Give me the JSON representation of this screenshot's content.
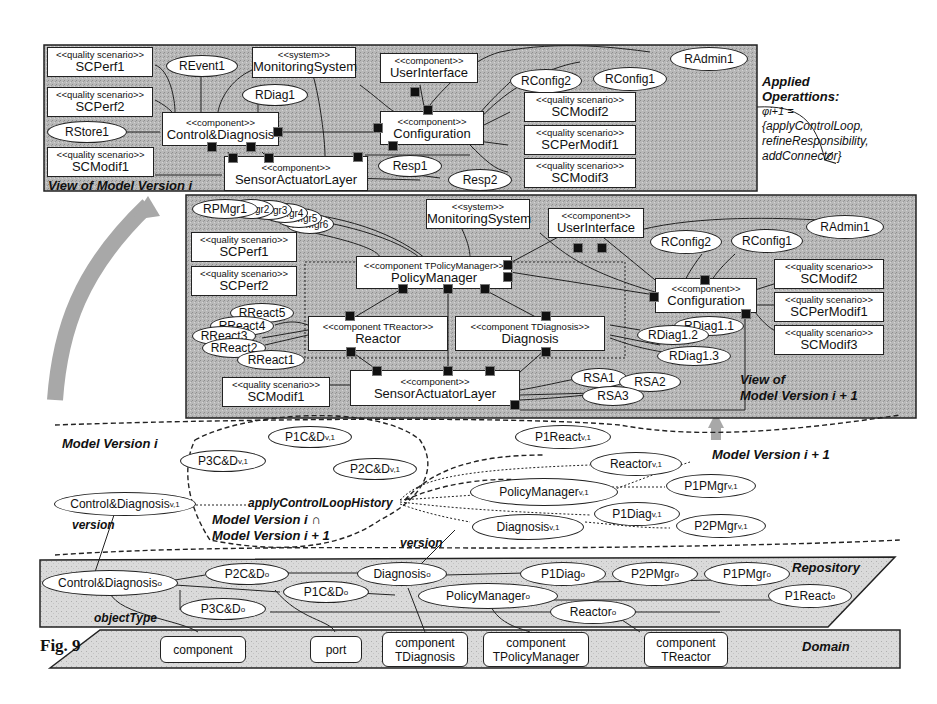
{
  "figure_label": "Fig. 9",
  "view_i": {
    "title": "View of Model Version i",
    "boxes": {
      "scperf1": {
        "stereo": "<<quality scenario>>",
        "name": "SCPerf1"
      },
      "scperf2": {
        "stereo": "<<quality scenario>>",
        "name": "SCPerf2"
      },
      "scmodif1": {
        "stereo": "<<quality scenario>>",
        "name": "SCModif1"
      },
      "monitoring": {
        "stereo": "<<system>>",
        "name": "MonitoringSystem"
      },
      "ui": {
        "stereo": "<<component>>",
        "name": "UserInterface"
      },
      "cd": {
        "stereo": "<<component>>",
        "name": "Control&Diagnosis"
      },
      "config": {
        "stereo": "<<component>>",
        "name": "Configuration"
      },
      "sal": {
        "stereo": "<<component>>",
        "name": "SensorActuatorLayer"
      },
      "scmodif2": {
        "stereo": "<<quality scenario>>",
        "name": "SCModif2"
      },
      "scpermodif1": {
        "stereo": "<<quality scenario>>",
        "name": "SCPerModif1"
      },
      "scmodif3": {
        "stereo": "<<quality scenario>>",
        "name": "SCModif3"
      }
    },
    "ellipses": {
      "revent1": "REvent1",
      "rdiag1": "RDiag1",
      "rstore1": "RStore1",
      "rconfig2": "RConfig2",
      "rconfig1": "RConfig1",
      "radmin1": "RAdmin1",
      "resp1": "Resp1",
      "resp2": "Resp2"
    }
  },
  "applied_operations": {
    "title_line1": "Applied",
    "title_line2": "Operattions:",
    "symbol": "φi+1 =",
    "line1": "{applyControlLoop,",
    "line2": "refineResponsibility,",
    "line3": "addConnector}"
  },
  "view_i1": {
    "title_line1": "View of",
    "title_line2": "Model Version i + 1",
    "boxes": {
      "monitoring": {
        "stereo": "<<system>>",
        "name": "MonitoringSystem"
      },
      "ui": {
        "stereo": "<<component>>",
        "name": "UserInterface"
      },
      "scperf1": {
        "stereo": "<<quality scenario>>",
        "name": "SCPerf1"
      },
      "scperf2": {
        "stereo": "<<quality scenario>>",
        "name": "SCPerf2"
      },
      "pm": {
        "stereo": "<<component TPolicyManager>>",
        "name": "PolicyManager"
      },
      "config": {
        "stereo": "<<component>>",
        "name": "Configuration"
      },
      "reactor": {
        "stereo": "<<component TReactor>>",
        "name": "Reactor"
      },
      "diagnosis": {
        "stereo": "<<component TDiagnosis>>",
        "name": "Diagnosis"
      },
      "scmodif1": {
        "stereo": "<<quality scenario>>",
        "name": "SCModif1"
      },
      "sal": {
        "stereo": "<<component>>",
        "name": "SensorActuatorLayer"
      },
      "scmodif2": {
        "stereo": "<<quality scenario>>",
        "name": "SCModif2"
      },
      "scpermodif1": {
        "stereo": "<<quality scenario>>",
        "name": "SCPerModif1"
      },
      "scmodif3": {
        "stereo": "<<quality scenario>>",
        "name": "SCModif3"
      }
    },
    "ellipses": {
      "rpmgr1": "RPMgr1",
      "rpmgr2": "RPMgr2",
      "rpmgr3": "RPMgr3",
      "rpmgr4": "RPMgr4",
      "rpmgr5": "RPMgr5",
      "rpmgr6": "RPMgr6",
      "rconfig2": "RConfig2",
      "rconfig1": "RConfig1",
      "radmin1": "RAdmin1",
      "rreact5": "RReact5",
      "rreact4": "RReact4",
      "rreact3": "RReact3",
      "rreact2": "RReact2",
      "rreact1": "RReact1",
      "rdiag11": "RDiag1.1",
      "rdiag12": "RDiag1.2",
      "rdiag13": "RDiag1.3",
      "rsa1": "RSA1",
      "rsa2": "RSA2",
      "rsa3": "RSA3"
    }
  },
  "versions": {
    "label_i": "Model Version i",
    "label_i1": "Model Version i + 1",
    "label_intersect_1": "Model Version i ∩",
    "label_intersect_2": "Model Version i + 1",
    "history_label": "applyControlLoopHistory",
    "version_label": "version",
    "nodes": {
      "cd": {
        "name": "Control&Diagnosis",
        "sub": "v,1"
      },
      "p1cd": {
        "name": "P1C&D",
        "sub": "v,1"
      },
      "p2cd": {
        "name": "P2C&D",
        "sub": "v,1"
      },
      "p3cd": {
        "name": "P3C&D",
        "sub": "v,1"
      },
      "p1react": {
        "name": "P1React",
        "sub": "v,1"
      },
      "reactor": {
        "name": "Reactor",
        "sub": "v,1"
      },
      "pm": {
        "name": "PolicyManager",
        "sub": "v,1"
      },
      "p1pmgr": {
        "name": "P1PMgr",
        "sub": "v,1"
      },
      "p1diag": {
        "name": "P1Diag",
        "sub": "v,1"
      },
      "diagnosis": {
        "name": "Diagnosis",
        "sub": "v,1"
      },
      "p2pmgr": {
        "name": "P2PMgr",
        "sub": "v,1"
      }
    }
  },
  "repository": {
    "label": "Repository",
    "object_type_label": "objectType",
    "nodes": {
      "cd": {
        "name": "Control&Diagnosis",
        "sub": "o"
      },
      "p2cd": {
        "name": "P2C&D",
        "sub": "o"
      },
      "p1cd": {
        "name": "P1C&D",
        "sub": "o"
      },
      "p3cd": {
        "name": "P3C&D",
        "sub": "o"
      },
      "diagnosis": {
        "name": "Diagnosis",
        "sub": "o"
      },
      "p1diag": {
        "name": "P1Diag",
        "sub": "o"
      },
      "p2pmgr": {
        "name": "P2PMgr",
        "sub": "o"
      },
      "p1pmgr": {
        "name": "P1PMgr",
        "sub": "o"
      },
      "pm": {
        "name": "PolicyManager",
        "sub": "o"
      },
      "reactor": {
        "name": "Reactor",
        "sub": "o"
      },
      "p1react": {
        "name": "P1React",
        "sub": "o"
      }
    }
  },
  "domain": {
    "label": "Domain",
    "types": [
      {
        "line1": "component",
        "line2": ""
      },
      {
        "line1": "port",
        "line2": ""
      },
      {
        "line1": "component",
        "line2": "TDiagnosis"
      },
      {
        "line1": "component",
        "line2": "TPolicyManager"
      },
      {
        "line1": "component",
        "line2": "TReactor"
      }
    ]
  },
  "colors": {
    "panel_gray": "#b5b5b5",
    "layer_gray": "#d6d6d6",
    "arrow_gray": "#a8a8a8",
    "ink": "#222222"
  }
}
